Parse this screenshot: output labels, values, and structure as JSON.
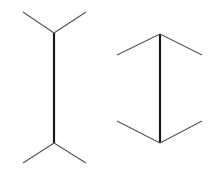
{
  "diagram": {
    "type": "muller-lyer-illusion",
    "colors": {
      "shaft": "#1a1a1a",
      "fin": "#555555",
      "background": "#ffffff"
    },
    "figures": [
      {
        "name": "outward-fins",
        "shaft": {
          "x": 54,
          "y1": 33,
          "y2": 143
        },
        "fins": [
          {
            "x1": 54,
            "y1": 33,
            "x2": 23,
            "y2": 12
          },
          {
            "x1": 54,
            "y1": 33,
            "x2": 86,
            "y2": 12
          },
          {
            "x1": 54,
            "y1": 143,
            "x2": 23,
            "y2": 163
          },
          {
            "x1": 54,
            "y1": 143,
            "x2": 86,
            "y2": 163
          }
        ]
      },
      {
        "name": "inward-fins",
        "shaft": {
          "x": 160,
          "y1": 34,
          "y2": 143
        },
        "fins": [
          {
            "x1": 160,
            "y1": 34,
            "x2": 117,
            "y2": 55
          },
          {
            "x1": 160,
            "y1": 34,
            "x2": 202,
            "y2": 55
          },
          {
            "x1": 160,
            "y1": 143,
            "x2": 117,
            "y2": 121
          },
          {
            "x1": 160,
            "y1": 143,
            "x2": 202,
            "y2": 121
          }
        ]
      }
    ]
  }
}
